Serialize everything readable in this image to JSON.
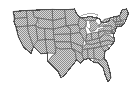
{
  "image": {
    "title": "Map of the contiguous United States",
    "subject": "United States state boundaries",
    "width_px": 138,
    "height_px": 93,
    "background_color": "#ffffff",
    "fill_description": "dithered checkerboard gray halftone",
    "fill_color": "#a8a8a8",
    "fill_dither_dark": "#8f8f8f",
    "fill_dither_light": "#d8d8d8",
    "state_border_color": "#6b6b6b",
    "national_border_color": "#4d4d4d",
    "lake_color": "#ffffff",
    "has_labels": false,
    "projection_note": "Lower 48 only; Alaska and Hawaii not shown"
  },
  "regions": {
    "west_label": "Western states",
    "midwest_label": "Midwestern states",
    "south_label": "Southern states",
    "northeast_label": "Northeastern states",
    "great_lakes_label": "Great Lakes"
  },
  "features": [
    {
      "id": "washington",
      "name": "Washington"
    },
    {
      "id": "oregon",
      "name": "Oregon"
    },
    {
      "id": "california",
      "name": "California"
    },
    {
      "id": "nevada",
      "name": "Nevada"
    },
    {
      "id": "idaho",
      "name": "Idaho"
    },
    {
      "id": "montana",
      "name": "Montana"
    },
    {
      "id": "wyoming",
      "name": "Wyoming"
    },
    {
      "id": "utah",
      "name": "Utah"
    },
    {
      "id": "arizona",
      "name": "Arizona"
    },
    {
      "id": "colorado",
      "name": "Colorado"
    },
    {
      "id": "new-mexico",
      "name": "New Mexico"
    },
    {
      "id": "north-dakota",
      "name": "North Dakota"
    },
    {
      "id": "south-dakota",
      "name": "South Dakota"
    },
    {
      "id": "nebraska",
      "name": "Nebraska"
    },
    {
      "id": "kansas",
      "name": "Kansas"
    },
    {
      "id": "oklahoma",
      "name": "Oklahoma"
    },
    {
      "id": "texas",
      "name": "Texas"
    },
    {
      "id": "minnesota",
      "name": "Minnesota"
    },
    {
      "id": "iowa",
      "name": "Iowa"
    },
    {
      "id": "missouri",
      "name": "Missouri"
    },
    {
      "id": "arkansas",
      "name": "Arkansas"
    },
    {
      "id": "louisiana",
      "name": "Louisiana"
    },
    {
      "id": "wisconsin",
      "name": "Wisconsin"
    },
    {
      "id": "illinois",
      "name": "Illinois"
    },
    {
      "id": "michigan",
      "name": "Michigan"
    },
    {
      "id": "indiana",
      "name": "Indiana"
    },
    {
      "id": "ohio",
      "name": "Ohio"
    },
    {
      "id": "kentucky",
      "name": "Kentucky"
    },
    {
      "id": "tennessee",
      "name": "Tennessee"
    },
    {
      "id": "mississippi",
      "name": "Mississippi"
    },
    {
      "id": "alabama",
      "name": "Alabama"
    },
    {
      "id": "georgia",
      "name": "Georgia"
    },
    {
      "id": "florida",
      "name": "Florida"
    },
    {
      "id": "south-carolina",
      "name": "South Carolina"
    },
    {
      "id": "north-carolina",
      "name": "North Carolina"
    },
    {
      "id": "virginia",
      "name": "Virginia"
    },
    {
      "id": "west-virginia",
      "name": "West Virginia"
    },
    {
      "id": "maryland",
      "name": "Maryland"
    },
    {
      "id": "delaware",
      "name": "Delaware"
    },
    {
      "id": "pennsylvania",
      "name": "Pennsylvania"
    },
    {
      "id": "new-jersey",
      "name": "New Jersey"
    },
    {
      "id": "new-york",
      "name": "New York"
    },
    {
      "id": "connecticut",
      "name": "Connecticut"
    },
    {
      "id": "rhode-island",
      "name": "Rhode Island"
    },
    {
      "id": "massachusetts",
      "name": "Massachusetts"
    },
    {
      "id": "vermont",
      "name": "Vermont"
    },
    {
      "id": "new-hampshire",
      "name": "New Hampshire"
    },
    {
      "id": "maine",
      "name": "Maine"
    }
  ]
}
